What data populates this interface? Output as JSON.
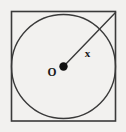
{
  "figure": {
    "background_color": "#f2f1ef",
    "stroke_color": "#3a3a3a",
    "label_color": "#1a1a1a",
    "width": 126,
    "height": 132,
    "labels": {
      "center_point": "O",
      "radius_segment": "x"
    },
    "shapes": {
      "square": {
        "x": 11.5,
        "y": 11.5,
        "width": 104,
        "height": 109.5,
        "stroke_width": 1.6
      },
      "circle": {
        "cx": 63.5,
        "cy": 66.5,
        "r": 52,
        "stroke_width": 1.4
      },
      "center_dot": {
        "cx": 63.5,
        "cy": 66.5,
        "r": 4.2
      },
      "radius_line": {
        "x1": 63.5,
        "y1": 66.5,
        "x2": 115.5,
        "y2": 12.5,
        "stroke_width": 1.4
      }
    },
    "label_positions": {
      "center_label": {
        "x": 52,
        "y": 76
      },
      "radius_label": {
        "x": 87.5,
        "y": 57
      }
    }
  }
}
